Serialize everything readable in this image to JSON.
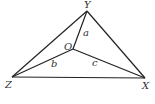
{
  "diagram": {
    "type": "triangle-with-interior-point",
    "colors": {
      "line": "#222222",
      "label": "#333333",
      "background": "#ffffff"
    },
    "points": {
      "Y": {
        "label": "Y",
        "x": 87,
        "y": 11,
        "lx": 84,
        "ly": 8
      },
      "Z": {
        "label": "Z",
        "x": 12,
        "y": 77,
        "lx": 5,
        "ly": 88
      },
      "X": {
        "label": "X",
        "x": 145,
        "y": 78,
        "lx": 142,
        "ly": 89
      },
      "O": {
        "label": "O",
        "x": 73,
        "y": 49,
        "lx": 64,
        "ly": 49
      }
    },
    "segments": [
      {
        "from": "Y",
        "to": "Z"
      },
      {
        "from": "Y",
        "to": "X"
      },
      {
        "from": "Z",
        "to": "X"
      },
      {
        "from": "O",
        "to": "Y",
        "label": "a"
      },
      {
        "from": "O",
        "to": "Z",
        "label": "b"
      },
      {
        "from": "O",
        "to": "X",
        "label": "c"
      }
    ],
    "segment_labels": {
      "a": {
        "text": "a",
        "x": 83,
        "y": 36
      },
      "b": {
        "text": "b",
        "x": 51,
        "y": 66
      },
      "c": {
        "text": "c",
        "x": 92,
        "y": 66
      }
    }
  }
}
